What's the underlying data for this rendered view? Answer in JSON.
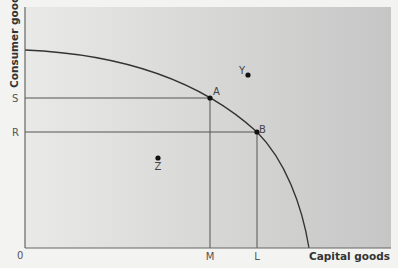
{
  "diagram": {
    "type": "production-possibility-frontier",
    "x_axis_title": "Capital goods",
    "y_axis_title": "Consumer goods",
    "origin_label": "0",
    "y_ticks": [
      {
        "id": "S",
        "label": "S"
      },
      {
        "id": "R",
        "label": "R"
      }
    ],
    "x_ticks": [
      {
        "id": "M",
        "label": "M"
      },
      {
        "id": "L",
        "label": "L"
      }
    ],
    "points": [
      {
        "id": "A",
        "label": "A",
        "position": "on-frontier",
        "x_ref": "M",
        "y_ref": "S"
      },
      {
        "id": "B",
        "label": "B",
        "position": "on-frontier",
        "x_ref": "L",
        "y_ref": "R"
      },
      {
        "id": "Y",
        "label": "Y",
        "position": "outside-frontier"
      },
      {
        "id": "Z",
        "label": "Z",
        "position": "inside-frontier"
      }
    ],
    "colors": {
      "background_left": "#e9e9e7",
      "background_right": "#c9c9c9",
      "line": "#555555",
      "curve": "#333333",
      "point": "#111111"
    }
  }
}
